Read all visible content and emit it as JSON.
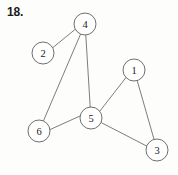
{
  "figure": {
    "problem_number": "18.",
    "background_color": "#fdfdfc",
    "node_fill": "#ffffff",
    "node_stroke": "#5f5f5f",
    "edge_stroke": "#6e6e6e",
    "label_color": "#222222",
    "node_radius": 11,
    "width": 178,
    "height": 175
  },
  "chart_data": {
    "type": "diagram",
    "title": "18.",
    "graph_kind": "undirected-graph",
    "nodes": [
      {
        "id": "4",
        "label": "4",
        "x": 85,
        "y": 24
      },
      {
        "id": "2",
        "label": "2",
        "x": 43,
        "y": 53
      },
      {
        "id": "1",
        "label": "1",
        "x": 134,
        "y": 70
      },
      {
        "id": "5",
        "label": "5",
        "x": 91,
        "y": 118
      },
      {
        "id": "6",
        "label": "6",
        "x": 39,
        "y": 131
      },
      {
        "id": "3",
        "label": "3",
        "x": 157,
        "y": 150
      }
    ],
    "edges": [
      {
        "from": "4",
        "to": "2",
        "x1": 75.6,
        "y1": 29.0,
        "x2": 52.4,
        "y2": 48.0
      },
      {
        "from": "4",
        "to": "6",
        "x1": 80.6,
        "y1": 34.0,
        "x2": 43.4,
        "y2": 121.0
      },
      {
        "from": "4",
        "to": "5",
        "x1": 85.8,
        "y1": 35.0,
        "x2": 90.2,
        "y2": 107.0
      },
      {
        "from": "5",
        "to": "6",
        "x1": 80.0,
        "y1": 116.0,
        "x2": 50.0,
        "y2": 129.6
      },
      {
        "from": "5",
        "to": "1",
        "x1": 99.8,
        "y1": 111.2,
        "x2": 126.0,
        "y2": 77.5
      },
      {
        "from": "5",
        "to": "3",
        "x1": 101.6,
        "y1": 122.8,
        "x2": 146.6,
        "y2": 146.0
      },
      {
        "from": "1",
        "to": "3",
        "x1": 137.2,
        "y1": 80.6,
        "x2": 154.0,
        "y2": 139.2
      }
    ],
    "node_count": 6,
    "edge_count": 7,
    "degrees": {
      "1": 2,
      "2": 1,
      "3": 2,
      "4": 3,
      "5": 4,
      "6": 2
    }
  }
}
